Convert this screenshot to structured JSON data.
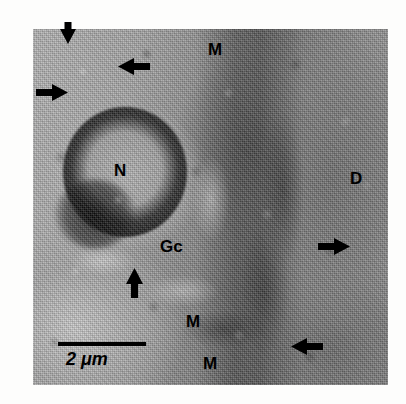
{
  "figure": {
    "type": "electron-micrograph",
    "modality": "grayscale transmission electron micrograph",
    "plate": {
      "x": 33,
      "y": 29,
      "width": 355,
      "height": 356
    },
    "background_color": "#ffffff",
    "annotation_color": "#000000"
  },
  "scale_bar": {
    "label": "2 μm",
    "length_px": 88,
    "x": 58,
    "y": 342,
    "thickness_px": 4,
    "label_x": 66,
    "label_y": 350
  },
  "labels": [
    {
      "id": "label-m-top",
      "text": "M",
      "x": 208,
      "y": 41,
      "size": 17,
      "meaning": "mitochondrion"
    },
    {
      "id": "label-d-right",
      "text": "D",
      "x": 350,
      "y": 170,
      "size": 17,
      "meaning": "dense-region"
    },
    {
      "id": "label-n-nucleus",
      "text": "N",
      "x": 114,
      "y": 162,
      "size": 17,
      "meaning": "nucleus"
    },
    {
      "id": "label-gc-golgi",
      "text": "Gc",
      "x": 160,
      "y": 238,
      "size": 17,
      "meaning": "golgi-complex"
    },
    {
      "id": "label-m-lower",
      "text": "M",
      "x": 186,
      "y": 313,
      "size": 17,
      "meaning": "mitochondrion"
    },
    {
      "id": "label-m-bottom",
      "text": "M",
      "x": 203,
      "y": 355,
      "size": 17,
      "meaning": "mitochondrion"
    }
  ],
  "arrows": [
    {
      "id": "arrow-top-down",
      "direction": "down",
      "x": 60,
      "y": 22,
      "length": 22,
      "width": 16
    },
    {
      "id": "arrow-upper-left",
      "direction": "left",
      "x": 118,
      "y": 58,
      "length": 32,
      "width": 17
    },
    {
      "id": "arrow-left-edge-right",
      "direction": "right",
      "x": 36,
      "y": 84,
      "length": 32,
      "width": 17
    },
    {
      "id": "arrow-center-up",
      "direction": "up",
      "x": 126,
      "y": 268,
      "length": 30,
      "width": 17
    },
    {
      "id": "arrow-right-mid",
      "direction": "right",
      "x": 318,
      "y": 238,
      "length": 32,
      "width": 17
    },
    {
      "id": "arrow-bottom-right",
      "direction": "left",
      "x": 291,
      "y": 338,
      "length": 32,
      "width": 17
    }
  ]
}
